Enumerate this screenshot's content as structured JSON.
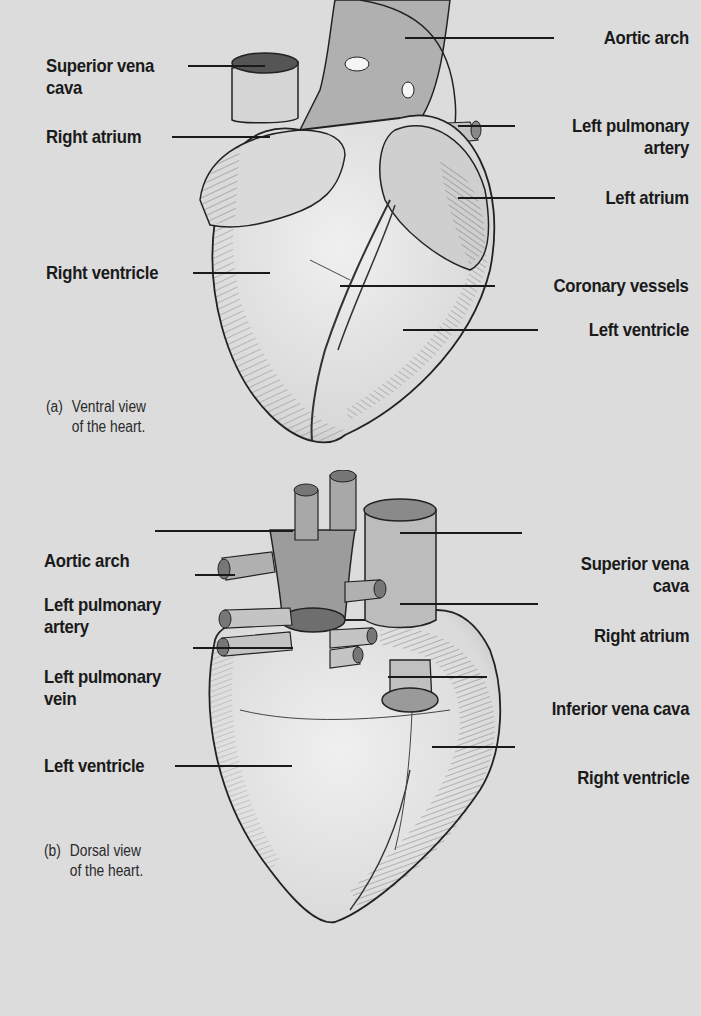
{
  "figure_a": {
    "caption_tag": "(a)",
    "caption_line1": "Ventral view",
    "caption_line2": "of the heart.",
    "labels": {
      "aortic_arch": "Aortic arch",
      "superior_vena_cava_1": "Superior vena",
      "superior_vena_cava_2": "cava",
      "right_atrium": "Right atrium",
      "left_pulmonary_artery_1": "Left pulmonary",
      "left_pulmonary_artery_2": "artery",
      "left_atrium": "Left atrium",
      "right_ventricle": "Right ventricle",
      "coronary_vessels": "Coronary vessels",
      "left_ventricle": "Left ventricle"
    }
  },
  "figure_b": {
    "caption_tag": "(b)",
    "caption_line1": "Dorsal view",
    "caption_line2": "of the heart.",
    "labels": {
      "aortic_arch": "Aortic arch",
      "left_pulmonary_artery_1": "Left pulmonary",
      "left_pulmonary_artery_2": "artery",
      "left_pulmonary_vein_1": "Left pulmonary",
      "left_pulmonary_vein_2": "vein",
      "left_ventricle": "Left ventricle",
      "superior_vena_cava_1": "Superior vena",
      "superior_vena_cava_2": "cava",
      "right_atrium": "Right atrium",
      "inferior_vena_cava": "Inferior vena cava",
      "right_ventricle": "Right ventricle"
    }
  },
  "colors": {
    "background": "#dcdcdc",
    "ink": "#1a1a1a",
    "vessel_fill": "#a9a9a9",
    "heart_fill": "#e6e6e6"
  }
}
